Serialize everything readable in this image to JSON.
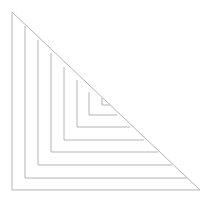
{
  "title_clipped": "",
  "diagram": {
    "stroke_color": "#b4b4b4",
    "triangles": [
      {
        "x": 12,
        "top": 12,
        "bottom": 190,
        "right": 200
      },
      {
        "x": 25,
        "top": 26,
        "bottom": 178,
        "right": 187
      },
      {
        "x": 38,
        "top": 40,
        "bottom": 165,
        "right": 172
      },
      {
        "x": 51,
        "top": 53,
        "bottom": 152,
        "right": 158
      },
      {
        "x": 64,
        "top": 67,
        "bottom": 140,
        "right": 144
      },
      {
        "x": 77,
        "top": 80,
        "bottom": 127,
        "right": 130
      },
      {
        "x": 89,
        "top": 92,
        "bottom": 115,
        "right": 117
      },
      {
        "x": 102,
        "top": 98,
        "bottom": 105,
        "right": 110
      }
    ]
  }
}
